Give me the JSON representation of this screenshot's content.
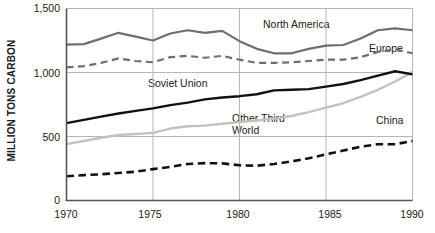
{
  "chart_data": {
    "type": "line",
    "title": "",
    "xlabel": "",
    "ylabel": "MILLION TONS CARBON",
    "xlim": [
      1970,
      1990
    ],
    "ylim": [
      0,
      1500
    ],
    "xticks": [
      "1970",
      "1975",
      "1980",
      "1985",
      "1990"
    ],
    "yticks": [
      "0",
      "500",
      "1,000",
      "1,500"
    ],
    "grid": "both-major",
    "legend_position": "inline-annotations",
    "x": [
      1970,
      1971,
      1972,
      1973,
      1974,
      1975,
      1976,
      1977,
      1978,
      1979,
      1980,
      1981,
      1982,
      1983,
      1984,
      1985,
      1986,
      1987,
      1988,
      1989,
      1990
    ],
    "series": [
      {
        "name": "North America",
        "style": "solid",
        "color": "#6e6e6e",
        "values": [
          1218,
          1222,
          1265,
          1310,
          1280,
          1250,
          1305,
          1330,
          1310,
          1325,
          1245,
          1185,
          1150,
          1150,
          1185,
          1210,
          1215,
          1265,
          1330,
          1345,
          1330
        ]
      },
      {
        "name": "Europe",
        "style": "dashed",
        "color": "#6e6e6e",
        "values": [
          1040,
          1050,
          1075,
          1110,
          1090,
          1080,
          1120,
          1130,
          1115,
          1130,
          1100,
          1075,
          1075,
          1080,
          1090,
          1100,
          1100,
          1120,
          1160,
          1180,
          1150
        ]
      },
      {
        "name": "Soviet Union",
        "style": "solid",
        "color": "#111111",
        "values": [
          605,
          630,
          655,
          680,
          700,
          720,
          745,
          765,
          790,
          805,
          815,
          830,
          860,
          865,
          870,
          890,
          910,
          940,
          975,
          1010,
          985
        ]
      },
      {
        "name": "Other Third World",
        "style": "solid",
        "color": "#c2c2c2",
        "values": [
          440,
          465,
          490,
          512,
          520,
          528,
          562,
          580,
          585,
          600,
          612,
          625,
          640,
          660,
          690,
          725,
          760,
          810,
          865,
          930,
          1005
        ]
      },
      {
        "name": "China",
        "style": "dashed",
        "color": "#111111",
        "values": [
          190,
          198,
          205,
          215,
          225,
          245,
          262,
          285,
          292,
          290,
          275,
          272,
          285,
          305,
          330,
          360,
          390,
          420,
          440,
          440,
          465
        ]
      }
    ]
  },
  "axis": {
    "y_label": "MILLION TONS CARBON",
    "y_ticks": [
      {
        "label": "1,500",
        "value": 1500
      },
      {
        "label": "1,000",
        "value": 1000
      },
      {
        "label": "500",
        "value": 500
      },
      {
        "label": "0",
        "value": 0
      }
    ],
    "x_ticks": [
      {
        "label": "1970",
        "value": 1970
      },
      {
        "label": "1975",
        "value": 1975
      },
      {
        "label": "1980",
        "value": 1980
      },
      {
        "label": "1985",
        "value": 1985
      },
      {
        "label": "1990",
        "value": 1990
      }
    ]
  },
  "annotations": [
    {
      "name": "north-america",
      "text": "North America",
      "x": 263,
      "y": 19
    },
    {
      "name": "europe",
      "text": "Europe",
      "x": 369,
      "y": 43
    },
    {
      "name": "soviet-union",
      "text": "Soviet Union",
      "x": 148,
      "y": 78
    },
    {
      "name": "other-third-world-line1",
      "text": "Other Third",
      "x": 232,
      "y": 113
    },
    {
      "name": "other-third-world-line2",
      "text": "World",
      "x": 232,
      "y": 125
    },
    {
      "name": "china",
      "text": "China",
      "x": 376,
      "y": 115
    }
  ],
  "colors": {
    "north_america": "#6e6e6e",
    "europe": "#6e6e6e",
    "soviet_union": "#111111",
    "other_third_world": "#c2c2c2",
    "china": "#111111",
    "axis": "#555555",
    "grid": "#b5b5b5",
    "background": "#ffffff",
    "text": "#1a1a1a"
  }
}
